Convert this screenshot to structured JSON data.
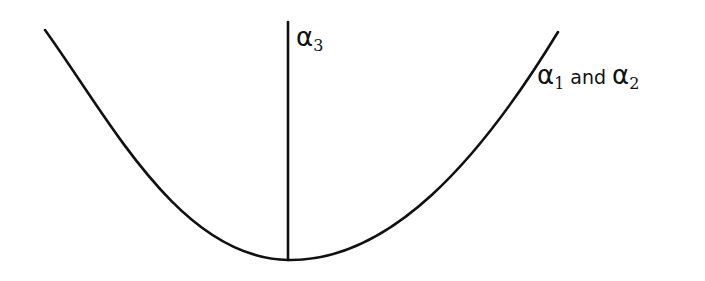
{
  "diagram": {
    "stroke_color": "#111111",
    "background": "#ffffff",
    "curve": {
      "shape": "parabola-like U curve",
      "left_end": [
        45,
        30
      ],
      "minimum": [
        288,
        260
      ],
      "right_end": [
        558,
        32
      ]
    },
    "vertical_axis": {
      "x": 288,
      "top": 22,
      "bottom": 260
    },
    "labels": {
      "vertical_line": {
        "symbol": "α",
        "subscript": "3"
      },
      "curve": {
        "symbol_1": "α",
        "subscript_1": "1",
        "conjunction": "and",
        "symbol_2": "α",
        "subscript_2": "2"
      }
    }
  }
}
